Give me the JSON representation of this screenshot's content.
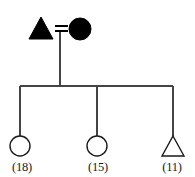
{
  "diagram": {
    "kind": "pedigree-chart",
    "background_color": "#ffffff",
    "line_color": "#444444",
    "filled_color": "#000000",
    "open_fill_color": "#ffffff",
    "open_stroke_color": "#1a1a1a"
  },
  "generations": [
    {
      "id": "generation-1",
      "members": [
        {
          "id": "father",
          "shape": "triangle",
          "shape_icon": "triangle-filled-icon",
          "status": "filled",
          "sex": "unspecified",
          "label": "",
          "cx": 41,
          "cy": 29
        },
        {
          "id": "mother",
          "shape": "circle",
          "shape_icon": "circle-filled-icon",
          "status": "filled",
          "sex": "female",
          "label": "",
          "cx": 80,
          "cy": 29
        }
      ],
      "mating": {
        "id": "mating-symbol",
        "symbol": "=",
        "symbol_icon": "equals-mating-icon",
        "x1": 55,
        "x2": 68,
        "y_top": 26,
        "y_bottom": 31
      }
    },
    {
      "id": "generation-2",
      "members": [
        {
          "id": "child-1",
          "shape": "circle",
          "shape_icon": "circle-open-icon",
          "status": "open",
          "sex": "female",
          "label": "(18)",
          "age": 18,
          "cx": 20,
          "cy": 146
        },
        {
          "id": "child-2",
          "shape": "circle",
          "shape_icon": "circle-open-icon",
          "status": "open",
          "sex": "female",
          "label": "(15)",
          "age": 15,
          "cx": 97,
          "cy": 146
        },
        {
          "id": "child-3",
          "shape": "triangle",
          "shape_icon": "triangle-open-icon",
          "status": "open",
          "sex": "unspecified",
          "label": "(11)",
          "age": 11,
          "cx": 173,
          "cy": 146
        }
      ]
    }
  ],
  "connectors": {
    "descent_line": {
      "x": 60,
      "y1": 31,
      "y2": 86
    },
    "sibship_line": {
      "y": 86,
      "x1": 20,
      "x2": 173
    },
    "drop_lines": [
      {
        "x": 20,
        "y1": 86,
        "y2": 136
      },
      {
        "x": 97,
        "y1": 86,
        "y2": 136
      },
      {
        "x": 173,
        "y1": 86,
        "y2": 136
      }
    ]
  },
  "labels": {
    "child_1_age": "(18)",
    "child_2_age": "(15)",
    "child_3_age": "(11)",
    "label_y": 171
  }
}
